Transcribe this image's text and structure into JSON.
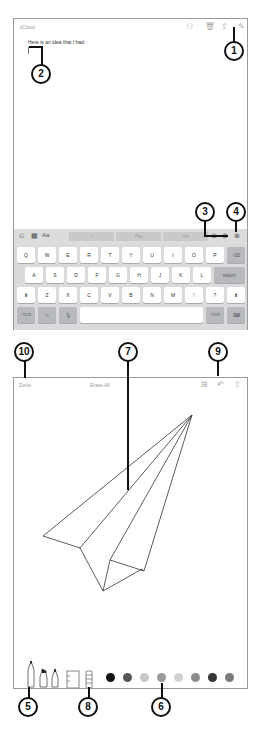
{
  "notes": {
    "back_label": "iCloud",
    "note_text": "Here is an idea that I had:",
    "toolbar_icons": [
      "people-add-icon",
      "trash-icon",
      "share-icon",
      "compose-icon"
    ],
    "keyboard": {
      "shortcut_icons": [
        "undo-icon",
        "table-icon",
        "format-Aa"
      ],
      "format_label": "Aa",
      "suggestions": [
        "I",
        "The",
        "I'm"
      ],
      "right_icons": [
        "checklist-icon",
        "add-icon",
        "sketch-icon"
      ],
      "row1": [
        "Q",
        "W",
        "E",
        "R",
        "T",
        "Y",
        "U",
        "I",
        "O",
        "P"
      ],
      "row2": [
        "A",
        "S",
        "D",
        "F",
        "G",
        "H",
        "J",
        "K",
        "L"
      ],
      "row3": [
        "Z",
        "X",
        "C",
        "V",
        "B",
        "N",
        "M",
        "!",
        "?"
      ],
      "return_label": "return",
      "numbers_label": ".?123",
      "backspace_icon": "⌫",
      "shift_icon": "⬆",
      "emoji_icon": "☺",
      "mic_icon": "🎙",
      "hide_keyboard_icon": "⌨"
    }
  },
  "sketch": {
    "done_label": "Done",
    "erase_all_label": "Erase All",
    "toolbar_icons": [
      "add-icon",
      "undo-icon",
      "share-icon"
    ],
    "tools": [
      "pen",
      "marker",
      "pencil",
      "eraser",
      "ruler"
    ],
    "colors": [
      "#111111",
      "#555555",
      "#c8c8c8",
      "#9a9a9a",
      "#d2d2d2",
      "#8c8c8c",
      "#333333",
      "#7a7a7a"
    ]
  },
  "callouts": {
    "c1": "1",
    "c2": "2",
    "c3": "3",
    "c4": "4",
    "c5": "5",
    "c6": "6",
    "c7": "7",
    "c8": "8",
    "c9": "9",
    "c10": "10"
  }
}
